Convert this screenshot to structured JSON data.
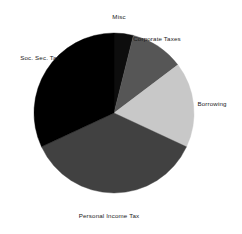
{
  "chart_data": {
    "type": "pie",
    "title": "",
    "subtitle": "",
    "xlabel": "",
    "ylabel": "",
    "legend_position": "none",
    "grid": false,
    "start_angle_deg": 0,
    "direction": "clockwise",
    "center": {
      "x": 114,
      "y": 113
    },
    "radius": 80,
    "categories": [
      "Misc",
      "Corporate Taxes",
      "Borrowing",
      "Personal Income Tax",
      "Soc. Sec. Tax"
    ],
    "values": [
      3.9,
      10.8,
      17.2,
      36.1,
      32.0
    ],
    "value_unit": "percent",
    "slices": [
      {
        "label": "Misc",
        "value": 3.9,
        "start_deg": 0,
        "end_deg": 14,
        "color": "#0d0d0d",
        "label_x": 119,
        "label_y": 14,
        "label_align": "center"
      },
      {
        "label": "Corporate Taxes",
        "value": 10.8,
        "start_deg": 14,
        "end_deg": 53,
        "color": "#565656",
        "label_x": 157,
        "label_y": 36,
        "label_align": "center"
      },
      {
        "label": "Borrowing",
        "value": 17.2,
        "start_deg": 53,
        "end_deg": 115,
        "color": "#c8c8c8",
        "label_x": 212,
        "label_y": 101,
        "label_align": "center"
      },
      {
        "label": "Personal Income Tax",
        "value": 36.1,
        "start_deg": 115,
        "end_deg": 245,
        "color": "#414141",
        "label_x": 109,
        "label_y": 213,
        "label_align": "center"
      },
      {
        "label": "Soc. Sec. Tax",
        "value": 32.0,
        "start_deg": 245,
        "end_deg": 360,
        "color": "#000000",
        "label_x": 40,
        "label_y": 55,
        "label_align": "center"
      }
    ]
  }
}
